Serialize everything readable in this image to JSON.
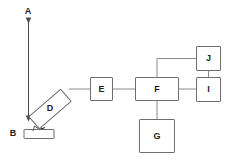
{
  "diagram": {
    "canvas": {
      "width": 227,
      "height": 163
    },
    "colors": {
      "background": "#ffffff",
      "box_stroke": "#6e6e6e",
      "link_stroke": "#8a8a8a",
      "beam_stroke": "#4a4a4a",
      "label_fill": "#1c1c1c"
    },
    "nodes": [
      {
        "id": "A",
        "label": "A",
        "shape": "arrow-label",
        "x": 28,
        "y": 19
      },
      {
        "id": "B",
        "label": "B",
        "shape": "flat-rect",
        "x": 38,
        "y": 134
      },
      {
        "id": "C",
        "label": "C",
        "shape": "squiggle-label",
        "x": 41,
        "y": 124
      },
      {
        "id": "D",
        "label": "D",
        "shape": "tilted-rect",
        "x": 50,
        "y": 109
      },
      {
        "id": "E",
        "label": "E",
        "shape": "rect",
        "x": 101,
        "y": 89
      },
      {
        "id": "F",
        "label": "F",
        "shape": "rect-wide",
        "x": 157,
        "y": 89
      },
      {
        "id": "G",
        "label": "G",
        "shape": "rect",
        "x": 157,
        "y": 139
      },
      {
        "id": "I",
        "label": "I",
        "shape": "rect",
        "x": 209,
        "y": 89
      },
      {
        "id": "J",
        "label": "J",
        "shape": "rect",
        "x": 209,
        "y": 59
      }
    ],
    "edges": [
      {
        "from": "A",
        "to": "B",
        "kind": "beam-arrow"
      },
      {
        "from": "B",
        "to": "D",
        "kind": "squiggle"
      },
      {
        "from": "D",
        "to": "E",
        "kind": "line"
      },
      {
        "from": "E",
        "to": "F",
        "kind": "line"
      },
      {
        "from": "F",
        "to": "G",
        "kind": "line"
      },
      {
        "from": "F",
        "to": "I",
        "kind": "line"
      },
      {
        "from": "F",
        "to": "J",
        "kind": "elbow-line"
      },
      {
        "from": "J",
        "to": "I",
        "kind": "line"
      }
    ]
  }
}
